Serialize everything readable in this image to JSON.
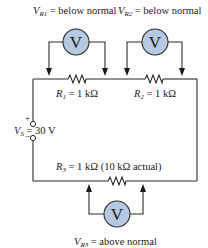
{
  "diagram": {
    "type": "series circuit with voltmeters",
    "source": {
      "label_prefix": "V",
      "label_sub": "S",
      "label_value": " = 30 V",
      "plus": "+",
      "minus": "−"
    },
    "resistors": [
      {
        "id": "R1",
        "label_prefix": "R",
        "label_sub": "1",
        "label_value": " = 1 kΩ"
      },
      {
        "id": "R2",
        "label_prefix": "R",
        "label_sub": "2",
        "label_value": " = 1 kΩ"
      },
      {
        "id": "R3",
        "label_prefix": "R",
        "label_sub": "3",
        "label_value": " = 1 kΩ (10 kΩ actual)"
      }
    ],
    "voltmeters": [
      {
        "id": "VM1",
        "symbol": "V",
        "reading_prefix": "V",
        "reading_sub": "R1",
        "reading_value": " = below normal"
      },
      {
        "id": "VM2",
        "symbol": "V",
        "reading_prefix": "V",
        "reading_sub": "R2",
        "reading_value": " = below normal"
      },
      {
        "id": "VM3",
        "symbol": "V",
        "reading_prefix": "V",
        "reading_sub": "R3",
        "reading_value": " = above normal"
      }
    ],
    "colors": {
      "meter_fill": "#b5c9e2",
      "wire": "#2a2a2a"
    }
  }
}
